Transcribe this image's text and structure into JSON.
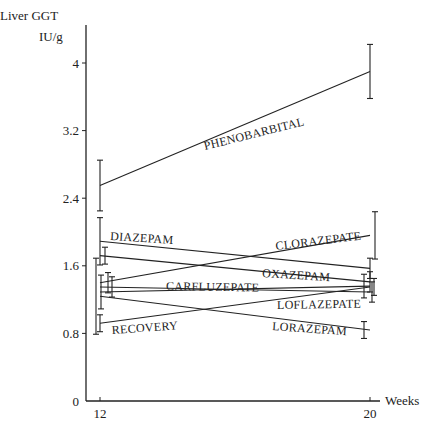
{
  "chart_data": {
    "type": "line",
    "title": "",
    "ylabel_line1": "Liver GGT",
    "ylabel_line2": "IU/g",
    "xlabel": "Weeks",
    "x": [
      12,
      20
    ],
    "x_tick_labels": [
      "12",
      "20"
    ],
    "y_ticks": [
      0,
      0.8,
      1.6,
      2.4,
      3.2,
      4
    ],
    "y_tick_labels": [
      "0",
      "0.8",
      "1.6",
      "2.4",
      "3.2",
      "4"
    ],
    "ylim": [
      0,
      4.3
    ],
    "grid": false,
    "legend": "inline labels",
    "series": [
      {
        "name": "PHENOBARBITAL",
        "values": [
          2.55,
          3.9
        ],
        "err": [
          0.3,
          0.32
        ],
        "label_pos": [
          205,
          150
        ],
        "label_angle": -14
      },
      {
        "name": "DIAZEPAM",
        "values": [
          1.89,
          1.57
        ],
        "err": [
          0.28,
          0.12
        ],
        "label_pos": [
          110,
          240
        ],
        "label_angle": 3.5
      },
      {
        "name": "OXAZEPAM",
        "values": [
          1.72,
          1.41
        ],
        "err": [
          0.1,
          0.12
        ],
        "label_pos": [
          262,
          277
        ],
        "label_angle": 3.5
      },
      {
        "name": "CLORAZEPATE",
        "values": [
          1.4,
          1.96
        ],
        "err": [
          0.12,
          0.28
        ],
        "label_pos": [
          276,
          250
        ],
        "label_angle": -7
      },
      {
        "name": "CARFLUZEPATE",
        "values": [
          1.35,
          1.29
        ],
        "err": [
          0.12,
          0.12
        ],
        "label_pos": [
          166,
          290
        ],
        "label_angle": 1
      },
      {
        "name": "LOFLAZEPATE",
        "values": [
          1.29,
          1.36
        ],
        "err": [
          0.2,
          0.14
        ],
        "label_pos": [
          277,
          309
        ],
        "label_angle": -1
      },
      {
        "name": "LORAZEPAM",
        "values": [
          1.24,
          0.84
        ],
        "err": [
          0.45,
          0.1
        ],
        "label_pos": [
          272,
          330
        ],
        "label_angle": 4
      },
      {
        "name": "RECOVERY",
        "values": [
          0.92,
          1.35
        ],
        "err": [
          0.1,
          0.1
        ],
        "label_pos": [
          112,
          334
        ],
        "label_angle": -4
      }
    ]
  }
}
